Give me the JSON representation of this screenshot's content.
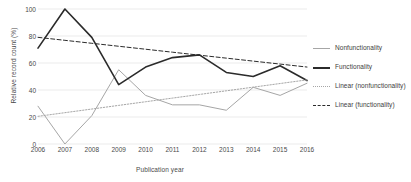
{
  "chart_data": {
    "type": "line",
    "title": "",
    "xlabel": "Publication year",
    "ylabel": "Relative record count (%)",
    "x": [
      2006,
      2007,
      2008,
      2009,
      2010,
      2011,
      2012,
      2013,
      2014,
      2015,
      2016
    ],
    "xticklabels": [
      "2006",
      "2007",
      "2008",
      "2009",
      "2010",
      "2011",
      "2012",
      "2013",
      "2014",
      "2015",
      "2016"
    ],
    "yticklabels": [
      "0",
      "20",
      "40",
      "60",
      "80",
      "100"
    ],
    "yticks": [
      0,
      20,
      40,
      60,
      80,
      100
    ],
    "xlim": [
      2006,
      2016
    ],
    "ylim": [
      0,
      100
    ],
    "grid": "horizontal",
    "legend_position": "right",
    "series": [
      {
        "name": "Nonfunctionality",
        "style": "solid",
        "color": "#a6a6a6",
        "width": 1,
        "values": [
          28,
          0,
          21,
          55,
          36,
          29,
          29,
          25,
          42,
          36,
          45
        ]
      },
      {
        "name": "Functionality",
        "style": "solid",
        "color": "#2b2b2b",
        "width": 1.6,
        "values": [
          71,
          100,
          79,
          44,
          57,
          64,
          66,
          53,
          50,
          58,
          47
        ]
      },
      {
        "name": "Linear (nonfunctionality)",
        "style": "dotted",
        "color": "#a6a6a6",
        "width": 1,
        "values": [
          20.5,
          23.2,
          25.9,
          28.6,
          31.3,
          34.0,
          36.7,
          39.4,
          42.1,
          44.8,
          47.5
        ]
      },
      {
        "name": "Linear (functionality)",
        "style": "dashed",
        "color": "#2b2b2b",
        "width": 1,
        "values": [
          79.0,
          76.8,
          74.6,
          72.4,
          70.2,
          68.0,
          65.8,
          63.6,
          61.4,
          59.2,
          57.0
        ]
      }
    ]
  },
  "legend": {
    "entries": [
      {
        "label": "Nonfunctionality"
      },
      {
        "label": "Functionality"
      },
      {
        "label": "Linear (nonfunctionality)"
      },
      {
        "label": "Linear (functionality)"
      }
    ]
  },
  "colors": {
    "nonfunctionality": "#a6a6a6",
    "functionality": "#2b2b2b",
    "grid": "#e6e6e6",
    "text": "#4a4a4a"
  }
}
